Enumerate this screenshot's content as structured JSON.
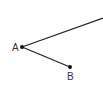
{
  "diagram": {
    "type": "geometry-angle",
    "stroke_color": "#222222",
    "points": {
      "A": {
        "label": "A",
        "x": 22,
        "y": 47
      },
      "B": {
        "label": "B",
        "x": 70,
        "y": 67
      },
      "ray_end": {
        "x": 103,
        "y": 18
      }
    },
    "segments": [
      {
        "from": "A",
        "to": "ray_end",
        "kind": "ray"
      },
      {
        "from": "A",
        "to": "B",
        "kind": "segment"
      }
    ]
  }
}
